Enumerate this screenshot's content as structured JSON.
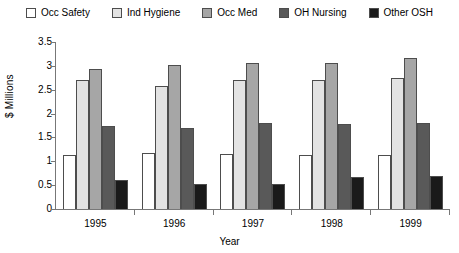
{
  "chart_data": {
    "type": "bar",
    "title": "",
    "xlabel": "Year",
    "ylabel": "$ Millions",
    "categories": [
      "1995",
      "1996",
      "1997",
      "1998",
      "1999"
    ],
    "ylim": [
      0,
      3.5
    ],
    "ytick_values": [
      0,
      0.5,
      1,
      1.5,
      2,
      2.5,
      3,
      3.5
    ],
    "ytick_labels": [
      "0",
      "0.5",
      "1",
      "1.5",
      "2",
      "2.5",
      "3",
      "3.5"
    ],
    "grid": false,
    "legend_position": "top",
    "series": [
      {
        "name": "Occ Safety",
        "color": "#ffffff",
        "values": [
          1.13,
          1.17,
          1.15,
          1.13,
          1.13
        ]
      },
      {
        "name": "Ind Hygiene",
        "color": "#e3e3e3",
        "values": [
          2.71,
          2.57,
          2.7,
          2.7,
          2.74
        ]
      },
      {
        "name": "Occ Med",
        "color": "#a6a6a6",
        "values": [
          2.93,
          3.02,
          3.05,
          3.05,
          3.16
        ]
      },
      {
        "name": "OH Nursing",
        "color": "#595959",
        "values": [
          1.74,
          1.7,
          1.8,
          1.79,
          1.8
        ]
      },
      {
        "name": "Other OSH",
        "color": "#1a1a1a",
        "values": [
          0.6,
          0.53,
          0.52,
          0.68,
          0.7
        ]
      }
    ]
  }
}
